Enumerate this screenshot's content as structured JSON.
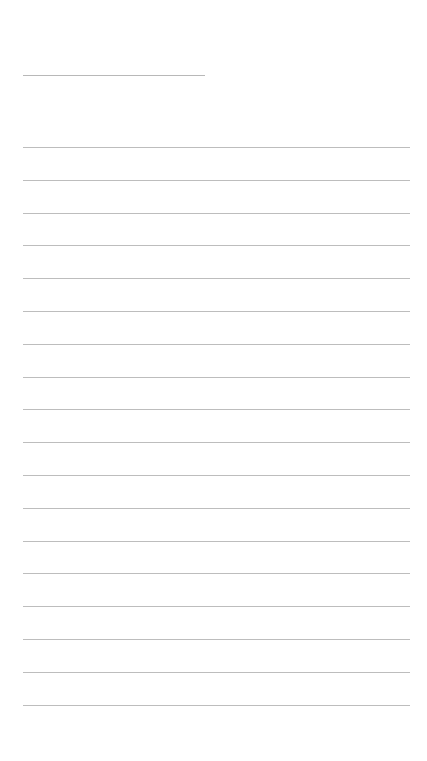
{
  "page": {
    "type": "blank ruled sheet",
    "background_color": "#ffffff",
    "line_color": "#bdbdbd",
    "title_line": {
      "x": 23,
      "y": 75,
      "width": 182
    },
    "ruled_lines": {
      "count": 18,
      "x": 23,
      "width": 387,
      "first_y": 147,
      "spacing": 32.8
    }
  }
}
